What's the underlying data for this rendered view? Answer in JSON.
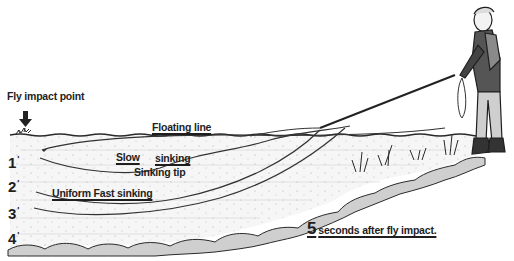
{
  "diagram": {
    "labels": {
      "fly_impact_point": "Fly impact point",
      "floating_line": "Floating line",
      "slow_sinking_part1": "Slow",
      "slow_sinking_part2": "sinking",
      "sinking_tip": "Sinking tip",
      "uniform_fast_sinking": "Uniform Fast sinking"
    },
    "depth_markers": [
      {
        "value": "1",
        "unit": "'"
      },
      {
        "value": "2",
        "unit": "'"
      },
      {
        "value": "3",
        "unit": "'"
      },
      {
        "value": "4",
        "unit": "'"
      }
    ],
    "caption": {
      "number": "5",
      "text": "seconds after fly impact."
    },
    "colors": {
      "ink": "#1e1e1e",
      "water_shade": "#e9e9e9",
      "rock_shade": "#bdbdbd",
      "background": "#ffffff"
    }
  }
}
